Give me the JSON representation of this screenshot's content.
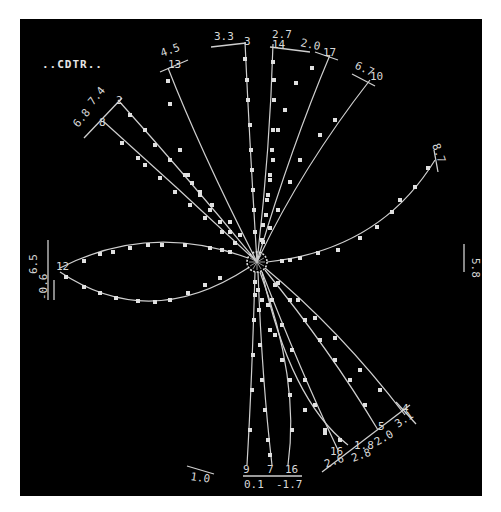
{
  "diagram": {
    "title": "..CDTR..",
    "background": "#000000",
    "line_color": "#cfcfcf",
    "hub": {
      "cx": 257,
      "cy": 262,
      "r": 10
    },
    "rays": [
      {
        "id": "2",
        "end_label": "2",
        "side_labels": [
          "7.4"
        ],
        "d": "M257,262 Q190,180 118,100",
        "nodes": [
          [
            130,
            115
          ],
          [
            145,
            130
          ],
          [
            155,
            145
          ],
          [
            170,
            160
          ],
          [
            185,
            175
          ],
          [
            200,
            192
          ],
          [
            212,
            205
          ],
          [
            230,
            222
          ],
          [
            240,
            235
          ]
        ]
      },
      {
        "id": "8",
        "end_label": "8",
        "side_labels": [
          "6.8"
        ],
        "d": "M257,262 Q180,190 103,121",
        "nodes": [
          [
            122,
            143
          ],
          [
            138,
            158
          ],
          [
            145,
            165
          ],
          [
            160,
            178
          ],
          [
            175,
            192
          ],
          [
            190,
            205
          ],
          [
            205,
            218
          ],
          [
            222,
            232
          ],
          [
            235,
            243
          ]
        ]
      },
      {
        "id": "13",
        "end_label": "13",
        "side_labels": [
          "4.5"
        ],
        "d": "M257,262 Q200,150 168,68",
        "nodes": [
          [
            168,
            81
          ],
          [
            170,
            104
          ],
          [
            180,
            150
          ],
          [
            188,
            175
          ],
          [
            192,
            183
          ],
          [
            200,
            195
          ],
          [
            210,
            210
          ],
          [
            220,
            222
          ],
          [
            230,
            232
          ]
        ]
      },
      {
        "id": "3",
        "end_label": "3",
        "side_labels": [
          "3.3"
        ],
        "d": "M257,262 Q250,150 245,42",
        "nodes": [
          [
            245,
            59
          ],
          [
            247,
            80
          ],
          [
            248,
            100
          ],
          [
            250,
            125
          ],
          [
            251,
            150
          ],
          [
            252,
            170
          ],
          [
            253,
            190
          ],
          [
            254,
            210
          ],
          [
            255,
            232
          ]
        ]
      },
      {
        "id": "14",
        "end_label": "14",
        "side_labels": [
          "2.7"
        ],
        "d": "M257,262 Q270,150 273,44",
        "nodes": [
          [
            273,
            62
          ],
          [
            274,
            80
          ],
          [
            274,
            100
          ],
          [
            273,
            130
          ],
          [
            272,
            150
          ],
          [
            270,
            175
          ],
          [
            268,
            195
          ],
          [
            266,
            215
          ],
          [
            262,
            240
          ]
        ]
      },
      {
        "id": "17",
        "end_label": "17",
        "side_labels": [
          "2.0"
        ],
        "d": "M257,262 Q290,150 330,55",
        "nodes": [
          [
            312,
            68
          ],
          [
            296,
            83
          ],
          [
            285,
            110
          ],
          [
            278,
            130
          ],
          [
            273,
            160
          ],
          [
            270,
            180
          ],
          [
            267,
            200
          ],
          [
            263,
            225
          ]
        ]
      },
      {
        "id": "10",
        "end_label": "10",
        "side_labels": [
          "6.7"
        ],
        "d": "M257,262 Q300,170 370,80",
        "nodes": [
          [
            335,
            120
          ],
          [
            320,
            135
          ],
          [
            300,
            160
          ],
          [
            290,
            182
          ],
          [
            278,
            210
          ],
          [
            270,
            228
          ],
          [
            263,
            242
          ]
        ]
      },
      {
        "id": "11",
        "end_label": "11",
        "side_labels": [
          "8.7"
        ],
        "d": "M267,262 Q380,250 435,160",
        "nodes": [
          [
            428,
            168
          ],
          [
            415,
            187
          ],
          [
            400,
            200
          ],
          [
            392,
            212
          ],
          [
            377,
            227
          ],
          [
            360,
            238
          ],
          [
            338,
            250
          ],
          [
            318,
            253
          ],
          [
            300,
            258
          ],
          [
            290,
            260
          ],
          [
            282,
            261
          ]
        ]
      },
      {
        "id": "12",
        "end_label": "12",
        "side_labels": [
          "6.5",
          "-0.6"
        ],
        "d": "M248,258 Q150,222 60,268",
        "nodes": [
          [
            84,
            261
          ],
          [
            100,
            254
          ],
          [
            113,
            252
          ],
          [
            130,
            248
          ],
          [
            148,
            245
          ],
          [
            162,
            245
          ],
          [
            185,
            245
          ],
          [
            210,
            248
          ],
          [
            222,
            250
          ],
          [
            230,
            252
          ]
        ]
      },
      {
        "id": "12b",
        "end_label": "",
        "side_labels": [],
        "d": "M248,268 Q150,332 60,272",
        "nodes": [
          [
            66,
            277
          ],
          [
            84,
            287
          ],
          [
            100,
            293
          ],
          [
            116,
            298
          ],
          [
            138,
            301
          ],
          [
            155,
            302
          ],
          [
            170,
            300
          ],
          [
            188,
            293
          ],
          [
            205,
            285
          ],
          [
            220,
            278
          ]
        ]
      },
      {
        "id": "9",
        "end_label": "9",
        "side_labels": [
          "0.1"
        ],
        "d": "M255,272 Q252,380 247,465",
        "nodes": [
          [
            255,
            282
          ],
          [
            255,
            295
          ],
          [
            254,
            320
          ],
          [
            253,
            355
          ],
          [
            252,
            390
          ],
          [
            250,
            430
          ]
        ]
      },
      {
        "id": "7",
        "end_label": "7",
        "side_labels": [
          "-1.7"
        ],
        "d": "M258,272 Q262,380 272,465",
        "nodes": [
          [
            258,
            290
          ],
          [
            259,
            310
          ],
          [
            260,
            345
          ],
          [
            262,
            380
          ],
          [
            265,
            410
          ],
          [
            268,
            440
          ],
          [
            270,
            455
          ]
        ]
      },
      {
        "id": "6",
        "end_label": "6",
        "side_labels": [],
        "d": "M260,272 Q300,380 288,465",
        "nodes": [
          [
            262,
            300
          ],
          [
            270,
            330
          ],
          [
            282,
            360
          ],
          [
            290,
            395
          ],
          [
            292,
            430
          ]
        ]
      },
      {
        "id": "16",
        "end_label": "16",
        "side_labels": [
          "2.6"
        ],
        "d": "M262,272 Q300,370 338,450",
        "nodes": [
          [
            272,
            300
          ],
          [
            282,
            325
          ],
          [
            292,
            350
          ],
          [
            305,
            380
          ],
          [
            315,
            405
          ],
          [
            325,
            430
          ]
        ]
      },
      {
        "id": "15",
        "end_label": "",
        "side_labels": [
          "1.8",
          "2.8"
        ],
        "d": "M262,272 Q290,400 348,445",
        "nodes": [
          [
            268,
            305
          ],
          [
            275,
            335
          ],
          [
            290,
            380
          ],
          [
            305,
            410
          ],
          [
            325,
            433
          ],
          [
            340,
            440
          ]
        ]
      },
      {
        "id": "5",
        "end_label": "5",
        "side_labels": [
          "2.0"
        ],
        "d": "M265,270 Q330,350 378,430",
        "nodes": [
          [
            275,
            285
          ],
          [
            290,
            300
          ],
          [
            305,
            320
          ],
          [
            320,
            340
          ],
          [
            335,
            360
          ],
          [
            350,
            380
          ],
          [
            365,
            405
          ]
        ]
      },
      {
        "id": "4",
        "end_label": "4",
        "side_labels": [
          "3.1"
        ],
        "d": "M265,268 Q340,330 405,415",
        "nodes": [
          [
            278,
            283
          ],
          [
            298,
            300
          ],
          [
            315,
            318
          ],
          [
            335,
            338
          ],
          [
            360,
            370
          ],
          [
            380,
            390
          ]
        ]
      }
    ],
    "labels": [
      {
        "text": "..CDTR..",
        "x": 42,
        "y": 68,
        "cls": "title"
      },
      {
        "text": "7.4",
        "x": 93,
        "y": 106,
        "rot": -50
      },
      {
        "text": "2",
        "x": 116,
        "y": 104
      },
      {
        "text": "6.8",
        "x": 78,
        "y": 128,
        "rot": -50
      },
      {
        "text": "8",
        "x": 99,
        "y": 126
      },
      {
        "text": "4.5",
        "x": 162,
        "y": 57,
        "rot": -20
      },
      {
        "text": "13",
        "x": 168,
        "y": 68
      },
      {
        "text": "3.3",
        "x": 214,
        "y": 40
      },
      {
        "text": "3",
        "x": 244,
        "y": 45
      },
      {
        "text": "2.7",
        "x": 272,
        "y": 38
      },
      {
        "text": "14",
        "x": 272,
        "y": 48
      },
      {
        "text": "2.0",
        "x": 300,
        "y": 46,
        "rot": 12
      },
      {
        "text": "17",
        "x": 323,
        "y": 56
      },
      {
        "text": "6.7",
        "x": 354,
        "y": 68,
        "rot": 25
      },
      {
        "text": "10",
        "x": 370,
        "y": 80
      },
      {
        "text": "8.7",
        "x": 432,
        "y": 145,
        "rot": 70
      },
      {
        "text": "6.5",
        "x": 37,
        "y": 274,
        "rot": -90
      },
      {
        "text": "-0.6",
        "x": 47,
        "y": 300,
        "rot": -90
      },
      {
        "text": "12",
        "x": 56,
        "y": 270
      },
      {
        "text": "5.8",
        "x": 472,
        "y": 258,
        "rot": 90
      },
      {
        "text": "1.0",
        "x": 190,
        "y": 480,
        "rot": 8
      },
      {
        "text": "9",
        "x": 243,
        "y": 473
      },
      {
        "text": "7",
        "x": 267,
        "y": 473
      },
      {
        "text": "16",
        "x": 285,
        "y": 473
      },
      {
        "text": "0.1",
        "x": 244,
        "y": 488
      },
      {
        "text": "-1.7",
        "x": 276,
        "y": 488
      },
      {
        "text": "2.6",
        "x": 326,
        "y": 468,
        "rot": -20
      },
      {
        "text": "16",
        "x": 330,
        "y": 455
      },
      {
        "text": "1.8",
        "x": 354,
        "y": 449
      },
      {
        "text": "2.8",
        "x": 353,
        "y": 462,
        "rot": -20
      },
      {
        "text": "5",
        "x": 378,
        "y": 430
      },
      {
        "text": "2.0",
        "x": 377,
        "y": 446,
        "rot": -30
      },
      {
        "text": "4",
        "x": 402,
        "y": 412
      },
      {
        "text": "3.1",
        "x": 398,
        "y": 428,
        "rot": -35
      }
    ],
    "ticks": [
      [
        84,
        138,
        122,
        98
      ],
      [
        160,
        72,
        188,
        60
      ],
      [
        211,
        47,
        246,
        43
      ],
      [
        270,
        47,
        310,
        52
      ],
      [
        315,
        52,
        338,
        60
      ],
      [
        352,
        74,
        375,
        86
      ],
      [
        434,
        150,
        438,
        172
      ],
      [
        48,
        240,
        48,
        300
      ],
      [
        54,
        280,
        54,
        300
      ],
      [
        464,
        244,
        464,
        272
      ],
      [
        187,
        466,
        214,
        474
      ],
      [
        243,
        476,
        302,
        476
      ],
      [
        322,
        472,
        410,
        405
      ],
      [
        396,
        402,
        416,
        424
      ]
    ]
  }
}
